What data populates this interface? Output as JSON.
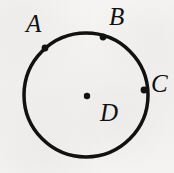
{
  "figure": {
    "kind": "circle-diagram",
    "background_color": "#f3f2f0",
    "ink_color": "#111111",
    "circle": {
      "center_x": 86,
      "center_y": 95,
      "radius": 62,
      "stroke_width": 3.5
    },
    "center_point": {
      "name": "center-dot",
      "x": 87,
      "y": 96,
      "radius": 3.2
    },
    "points": [
      {
        "id": "A",
        "label": "A",
        "marker_x": 45,
        "marker_y": 48,
        "marker_radius": 3.4
      },
      {
        "id": "B",
        "label": "B",
        "marker_x": 103,
        "marker_y": 37,
        "marker_radius": 3.4
      },
      {
        "id": "C",
        "label": "C",
        "marker_x": 144,
        "marker_y": 90,
        "marker_radius": 3.4
      }
    ],
    "labels": {
      "a": "A",
      "b": "B",
      "c": "C",
      "d": "D"
    }
  }
}
